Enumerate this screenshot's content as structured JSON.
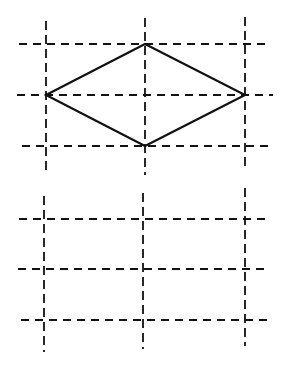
{
  "diagram": {
    "background": "#ffffff",
    "stroke_color": "#111111",
    "top_grid": {
      "vertical_lines": [
        {
          "x": 46,
          "y1": 21,
          "y2": 172
        },
        {
          "x": 145,
          "y1": 18,
          "y2": 175
        },
        {
          "x": 245,
          "y1": 17,
          "y2": 170
        }
      ],
      "horizontal_lines": [
        {
          "y": 44,
          "x1": 19,
          "x2": 268
        },
        {
          "y": 95,
          "x1": 17,
          "x2": 273
        },
        {
          "y": 146,
          "x1": 22,
          "x2": 270
        }
      ]
    },
    "diamond": {
      "points": [
        [
          46,
          95
        ],
        [
          145,
          44
        ],
        [
          245,
          95
        ],
        [
          145,
          146
        ]
      ]
    },
    "bottom_grid": {
      "vertical_lines": [
        {
          "x": 44,
          "y1": 196,
          "y2": 352
        },
        {
          "x": 143,
          "y1": 193,
          "y2": 349
        },
        {
          "x": 245,
          "y1": 188,
          "y2": 346
        }
      ],
      "horizontal_lines": [
        {
          "y": 219,
          "x1": 19,
          "x2": 268
        },
        {
          "y": 269,
          "x1": 18,
          "x2": 267
        },
        {
          "y": 320,
          "x1": 21,
          "x2": 272
        }
      ]
    }
  }
}
